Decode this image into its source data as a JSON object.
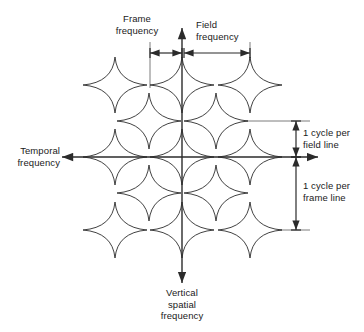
{
  "figure": {
    "type": "diagram",
    "background_color": "#ffffff",
    "line_color": "#2b2b2b",
    "leader_color": "#5a5a5a"
  },
  "axes": {
    "horizontal": {
      "name": "temporal-frequency-axis",
      "label": "Temporal\nfrequency",
      "label_lines": [
        "Temporal",
        "frequency"
      ],
      "direction": "bidirectional",
      "y": 157,
      "x_start": 62,
      "x_end": 318
    },
    "vertical": {
      "name": "vertical-spatial-frequency-axis",
      "label": "Vertical\nspatial\nfrequency",
      "label_lines": [
        "Vertical",
        "spatial",
        "frequency"
      ],
      "direction": "bidirectional",
      "x": 182,
      "y_start": 28,
      "y_end": 283
    }
  },
  "dimensions": [
    {
      "name": "frame-frequency-dimension",
      "label": "Frame\nfrequency",
      "label_lines": [
        "Frame",
        "frequency"
      ],
      "orientation": "horizontal",
      "from": 150,
      "to": 182,
      "at": 53,
      "has_leader": true
    },
    {
      "name": "field-frequency-dimension",
      "label": "Field\nfrequency",
      "label_lines": [
        "Field",
        "frequency"
      ],
      "orientation": "horizontal",
      "from": 184,
      "to": 250,
      "at": 53,
      "has_leader": true
    },
    {
      "name": "one-cycle-per-field-line-dimension",
      "label": "1 cycle per\nfield line",
      "label_lines": [
        "1 cycle per",
        "field line"
      ],
      "orientation": "vertical",
      "from": 121,
      "to": 157,
      "at": 296,
      "has_leader": true
    },
    {
      "name": "one-cycle-per-frame-line-dimension",
      "label": "1 cycle per\nframe line",
      "label_lines": [
        "1 cycle per",
        "frame line"
      ],
      "orientation": "vertical",
      "from": 157,
      "to": 230,
      "at": 296,
      "has_leader": true
    }
  ],
  "spectrum_points": {
    "description": "Four-pointed star glyphs marking spectral lobes on a quincunx lattice",
    "glyph": "four-pointed-star",
    "column_spacing_px": 67.5,
    "row_spacing_px": 36,
    "rows": [
      {
        "row": 1,
        "y": 85,
        "xs": [
          115,
          182,
          250
        ]
      },
      {
        "row": 2,
        "y": 121,
        "xs": [
          149,
          216
        ]
      },
      {
        "row": 3,
        "y": 157,
        "xs": [
          115,
          182,
          250
        ]
      },
      {
        "row": 4,
        "y": 193,
        "xs": [
          149,
          216
        ]
      },
      {
        "row": 5,
        "y": 230,
        "xs": [
          115,
          182,
          250
        ]
      }
    ],
    "star_radius_x": 32,
    "star_radius_y": 28,
    "star_waist": 7
  },
  "leaders": [
    {
      "name": "frame-frequency-leader",
      "x1": 150,
      "y1": 42,
      "x2": 150,
      "y2": 88
    },
    {
      "name": "field-frequency-leader",
      "x1": 250,
      "y1": 42,
      "x2": 250,
      "y2": 63
    },
    {
      "name": "field-line-leader",
      "x1": 232,
      "y1": 121,
      "x2": 310,
      "y2": 121
    },
    {
      "name": "frame-line-leader",
      "x1": 266,
      "y1": 230,
      "x2": 310,
      "y2": 230
    }
  ]
}
